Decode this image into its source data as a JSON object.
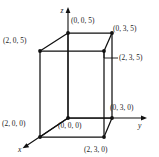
{
  "figure": {
    "title": "",
    "type": "3d-coordinate-box-diagram",
    "background_color": "#ffffff",
    "line_color": "#111111",
    "text_color": "#1a1a1a",
    "box_dimensions": {
      "x": 2,
      "y": 3,
      "z": 5
    }
  },
  "axes": [
    {
      "name": "x-axis",
      "label": "x",
      "direction": "down-left"
    },
    {
      "name": "y-axis",
      "label": "y",
      "direction": "right"
    },
    {
      "name": "z-axis",
      "label": "z",
      "direction": "up"
    }
  ],
  "vertices": [
    {
      "name": "origin",
      "label": "(0, 0, 0)",
      "coords": [
        0,
        0,
        0
      ]
    },
    {
      "name": "x-corner",
      "label": "(2, 0, 0)",
      "coords": [
        2,
        0,
        0
      ]
    },
    {
      "name": "y-corner",
      "label": "(0, 3, 0)",
      "coords": [
        0,
        3,
        0
      ]
    },
    {
      "name": "xy-corner",
      "label": "(2, 3, 0)",
      "coords": [
        2,
        3,
        0
      ]
    },
    {
      "name": "z-corner",
      "label": "(0, 0, 5)",
      "coords": [
        0,
        0,
        5
      ]
    },
    {
      "name": "xz-corner",
      "label": "(2, 0, 5)",
      "coords": [
        2,
        0,
        5
      ]
    },
    {
      "name": "yz-corner",
      "label": "(0, 3, 5)",
      "coords": [
        0,
        3,
        5
      ]
    },
    {
      "name": "xyz-corner",
      "label": "(2, 3, 5)",
      "coords": [
        2,
        3,
        5
      ]
    }
  ]
}
